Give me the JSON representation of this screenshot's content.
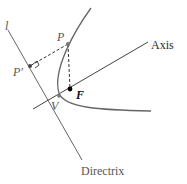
{
  "figure": {
    "type": "parabola-focus-directrix",
    "labels": {
      "directrix_symbol": "l",
      "point_p": "P",
      "point_p_prime": "P'",
      "focus": "F",
      "vertex": "V",
      "axis": "Axis",
      "directrix": "Directrix"
    },
    "colors": {
      "line": "#555555",
      "curve": "#666666",
      "dashed": "#333333",
      "focus_point": "#000000",
      "other_points": "#555555"
    }
  }
}
